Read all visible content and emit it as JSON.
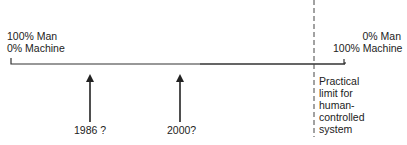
{
  "diagram": {
    "left_end": {
      "line1": "100% Man",
      "line2": "0% Machine"
    },
    "right_end": {
      "line1": "0% Man",
      "line2": "100% Machine"
    },
    "markers": [
      {
        "label": "1986 ?"
      },
      {
        "label": "2000?"
      }
    ],
    "limit_label": [
      "Practical",
      "limit for",
      "human-",
      "controlled",
      "system"
    ],
    "colors": {
      "ink": "#222222",
      "background": "#ffffff"
    }
  }
}
